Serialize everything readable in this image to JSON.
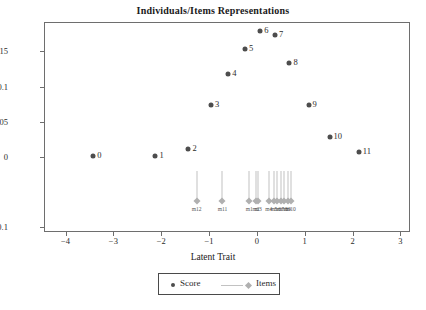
{
  "chart_data": {
    "type": "scatter",
    "title": "Individuals/Items Representations",
    "xlabel": "Latent Trait",
    "ylabel": "",
    "xlim": [
      -4.45,
      3.2
    ],
    "ylim": [
      -0.107,
      0.192
    ],
    "grid": false,
    "xticks": [
      -4,
      -3,
      -2,
      -1,
      0,
      1,
      2,
      3
    ],
    "xticklabels": [
      "−4",
      "−3",
      "−2",
      "−1",
      "0",
      "1",
      "2",
      "3"
    ],
    "yticks": [
      0.15,
      0.1,
      0.05,
      0,
      -0.1
    ],
    "yticklabels": [
      "0.15",
      "0.1",
      "0.05",
      "0",
      "−0.1"
    ],
    "series": [
      {
        "name": "Score",
        "type": "scatter",
        "marker": "circle",
        "color": "#4d4d4d",
        "points": [
          {
            "label": "0",
            "x": -3.42,
            "y": 0.0005
          },
          {
            "label": "1",
            "x": -2.12,
            "y": 0.0015
          },
          {
            "label": "2",
            "x": -1.43,
            "y": 0.0105
          },
          {
            "label": "3",
            "x": -0.96,
            "y": 0.0735
          },
          {
            "label": "4",
            "x": -0.6,
            "y": 0.1175
          },
          {
            "label": "5",
            "x": -0.25,
            "y": 0.1535
          },
          {
            "label": "6",
            "x": 0.07,
            "y": 0.1785
          },
          {
            "label": "7",
            "x": 0.38,
            "y": 0.1735
          },
          {
            "label": "8",
            "x": 0.68,
            "y": 0.1335
          },
          {
            "label": "9",
            "x": 1.08,
            "y": 0.0745
          },
          {
            "label": "10",
            "x": 1.52,
            "y": 0.0285
          },
          {
            "label": "11",
            "x": 2.13,
            "y": 0.0075
          }
        ]
      },
      {
        "name": "Items",
        "type": "stem",
        "marker": "diamond",
        "color": "#b0b0b0",
        "stem_top": -0.0195,
        "baseline": -0.0635,
        "points": [
          {
            "label": "m12",
            "x": -1.26,
            "y": -0.0635
          },
          {
            "label": "m11",
            "x": -0.72,
            "y": -0.0635
          },
          {
            "label": "m1",
            "x": -0.16,
            "y": -0.0635
          },
          {
            "label": "m2",
            "x": -0.02,
            "y": -0.0635
          },
          {
            "label": "m3",
            "x": 0.03,
            "y": -0.0635
          },
          {
            "label": "m4",
            "x": 0.25,
            "y": -0.0635
          },
          {
            "label": "m5",
            "x": 0.35,
            "y": -0.0635
          },
          {
            "label": "m6",
            "x": 0.43,
            "y": -0.0635
          },
          {
            "label": "m7",
            "x": 0.5,
            "y": -0.0635
          },
          {
            "label": "m8",
            "x": 0.57,
            "y": -0.0635
          },
          {
            "label": "m9",
            "x": 0.64,
            "y": -0.0635
          },
          {
            "label": "m10",
            "x": 0.71,
            "y": -0.0635
          }
        ]
      }
    ],
    "legend": {
      "position": "bottom",
      "entries": [
        {
          "label": "Score",
          "marker": "circle",
          "color": "#4d4d4d"
        },
        {
          "label": "Items",
          "marker": "line-diamond",
          "color": "#b0b0b0"
        }
      ]
    }
  }
}
